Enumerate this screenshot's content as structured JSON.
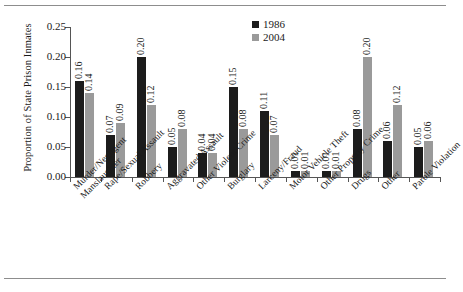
{
  "chart_data": {
    "type": "bar",
    "title": "",
    "xlabel": "",
    "ylabel": "Proportion of State Prison Inmates",
    "ylim": [
      0,
      0.25
    ],
    "ytick_labels": [
      "0.00",
      "0.05",
      "0.10",
      "0.15",
      "0.20",
      "0.25"
    ],
    "ytick_values": [
      0,
      0.05,
      0.1,
      0.15,
      0.2,
      0.25
    ],
    "grid": false,
    "legend_position": "top-right",
    "categories": [
      "Murder/Negligent Manslaughter",
      "Rape/Sexual Assault",
      "Robbery",
      "Aggravated Assault",
      "Other Violent Crime",
      "Burglary",
      "Larceny/Fraud",
      "Motor Vehicle Theft",
      "Other Property Crime",
      "Drugs",
      "Other",
      "Parole Violation"
    ],
    "category_lines": [
      [
        "Murder/Negligent",
        "Manslaughter"
      ],
      [
        "Rape/Sexual Assault"
      ],
      [
        "Robbery"
      ],
      [
        "Aggravated Assault"
      ],
      [
        "Other Violent Crime"
      ],
      [
        "Burglary"
      ],
      [
        "Larceny/Fraud"
      ],
      [
        "Motor Vehicle Theft"
      ],
      [
        "Other Property Crime"
      ],
      [
        "Drugs"
      ],
      [
        "Other"
      ],
      [
        "Parole Violation"
      ]
    ],
    "series": [
      {
        "name": "1986",
        "color": "#1c1c1c",
        "values": [
          0.16,
          0.07,
          0.2,
          0.05,
          0.04,
          0.15,
          0.11,
          0.01,
          0.01,
          0.08,
          0.06,
          0.05
        ],
        "labels": [
          "0.16",
          "0.07",
          "0.20",
          "0.05",
          "0.04",
          "0.15",
          "0.11",
          "0.01",
          "0.01",
          "0.08",
          "0.06",
          "0.05"
        ]
      },
      {
        "name": "2004",
        "color": "#9a9a9a",
        "values": [
          0.14,
          0.09,
          0.12,
          0.08,
          0.04,
          0.08,
          0.07,
          0.01,
          0.01,
          0.2,
          0.12,
          0.06
        ],
        "labels": [
          "0.14",
          "0.09",
          "0.12",
          "0.08",
          "0.04",
          "0.08",
          "0.07",
          "0.01",
          "0.01",
          "0.20",
          "0.12",
          "0.06"
        ]
      }
    ]
  }
}
